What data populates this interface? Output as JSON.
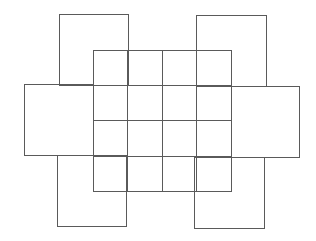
{
  "diagram": {
    "type": "overlapping-squares-net",
    "width": 316,
    "height": 241,
    "stroke_color": "#5a5a5a",
    "background": "#ffffff",
    "grid": {
      "x": 93,
      "y": 50,
      "width": 138,
      "height": 141,
      "rows": 4,
      "cols": 4,
      "col_lines": [
        127,
        162,
        196
      ],
      "row_lines": [
        85,
        120,
        156
      ]
    },
    "rects": [
      {
        "name": "top-left-square",
        "x": 59,
        "y": 14,
        "w": 69,
        "h": 71
      },
      {
        "name": "top-right-square",
        "x": 196,
        "y": 15,
        "w": 70,
        "h": 71
      },
      {
        "name": "left-square",
        "x": 24,
        "y": 84,
        "w": 69,
        "h": 71
      },
      {
        "name": "right-square",
        "x": 231,
        "y": 86,
        "w": 68,
        "h": 71
      },
      {
        "name": "bottom-left-square",
        "x": 57,
        "y": 155,
        "w": 69,
        "h": 71
      },
      {
        "name": "bottom-right-square",
        "x": 194,
        "y": 157,
        "w": 70,
        "h": 71
      }
    ]
  }
}
